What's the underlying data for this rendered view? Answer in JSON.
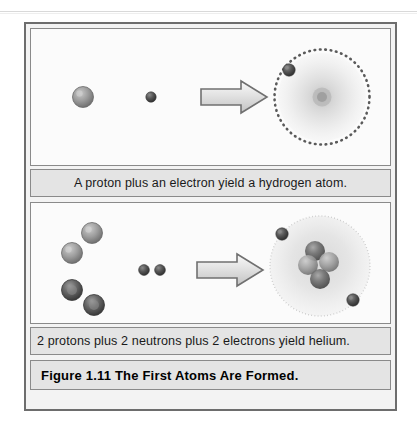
{
  "figure": {
    "title": "Figure 1.11  The First Atoms Are Formed.",
    "frame_border_color": "#6d6d6d",
    "band_background": "#e4e4e4",
    "panel_background": "#fbfbfb"
  },
  "panels": [
    {
      "id": "hydrogen",
      "caption": "A proton plus an electron yield a hydrogen atom.",
      "reactants": [
        {
          "name": "proton",
          "label": "proton",
          "cx": 52,
          "cy": 68,
          "r": 10,
          "color": "#8e8e8e"
        },
        {
          "name": "electron",
          "label": "electron",
          "cx": 120,
          "cy": 68,
          "r": 5,
          "color": "#4a4a4a"
        }
      ],
      "arrow": {
        "x": 170,
        "y": 68,
        "length": 64,
        "fill": "#d8d8d8",
        "stroke": "#6b6b6b"
      },
      "product": {
        "name": "hydrogen-atom",
        "cx": 291,
        "cy": 68,
        "cloud_radius": 44,
        "orbit_radius": 47,
        "orbit_dots": 52,
        "nucleus_radius": 9,
        "electrons": [
          {
            "cx": 256,
            "cy": 39,
            "r": 6
          }
        ]
      }
    },
    {
      "id": "helium",
      "caption": "2 protons plus 2 neutrons plus 2 electrons yield helium.",
      "reactants": [
        {
          "name": "proton",
          "label": "proton",
          "cx": 61,
          "cy": 30,
          "r": 10,
          "color": "#8e8e8e"
        },
        {
          "name": "proton",
          "label": "proton",
          "cx": 41,
          "cy": 50,
          "r": 10,
          "color": "#8e8e8e"
        },
        {
          "name": "neutron",
          "label": "neutron",
          "cx": 41,
          "cy": 87,
          "r": 10,
          "color": "#5c5c5c"
        },
        {
          "name": "neutron",
          "label": "neutron",
          "cx": 63,
          "cy": 102,
          "r": 10,
          "color": "#5c5c5c"
        },
        {
          "name": "electron",
          "label": "electron",
          "cx": 113,
          "cy": 67,
          "r": 5,
          "color": "#4a4a4a"
        },
        {
          "name": "electron",
          "label": "electron",
          "cx": 128,
          "cy": 67,
          "r": 5,
          "color": "#4a4a4a"
        }
      ],
      "arrow": {
        "x": 166,
        "y": 67,
        "length": 64,
        "fill": "#d8d8d8",
        "stroke": "#6b6b6b"
      },
      "product": {
        "name": "helium-atom",
        "cx": 289,
        "cy": 63,
        "cloud_radius": 50,
        "nucleons": [
          {
            "type": "proton",
            "cx": 283,
            "cy": 48,
            "r": 10
          },
          {
            "type": "neutron",
            "cx": 297,
            "cy": 58,
            "r": 10
          },
          {
            "type": "proton",
            "cx": 278,
            "cy": 63,
            "r": 10
          },
          {
            "type": "neutron",
            "cx": 288,
            "cy": 76,
            "r": 10
          }
        ],
        "electrons": [
          {
            "cx": 252,
            "cy": 32,
            "r": 6
          },
          {
            "cx": 320,
            "cy": 95,
            "r": 6
          }
        ]
      }
    }
  ]
}
